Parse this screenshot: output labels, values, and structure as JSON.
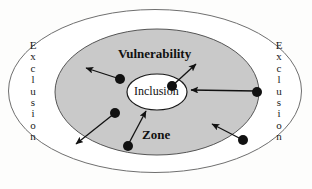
{
  "diagram": {
    "title_concept": "Vulnerability Zone",
    "labels": {
      "exclusion_left": "Exclusion",
      "exclusion_right": "Exclusion",
      "vulnerability": "Vulnerability",
      "zone": "Zone",
      "inclusion": "Inclusion"
    },
    "colors": {
      "outer_fill": "#ffffff",
      "outer_stroke": "#6f6f6f",
      "middle_fill": "#c9c9c9",
      "middle_stroke": "#555555",
      "inner_fill": "#ffffff",
      "inner_stroke": "#1a1a1a",
      "dot_fill": "#111111",
      "arrow_stroke": "#111111",
      "text": "#111111",
      "background": "#fdfdfc"
    },
    "ellipses": [
      {
        "name": "exclusion-outer-ellipse",
        "cx": 155,
        "cy": 91,
        "rx": 147,
        "ry": 82
      },
      {
        "name": "vulnerability-zone-ellipse",
        "cx": 157,
        "cy": 92,
        "rx": 102,
        "ry": 63
      },
      {
        "name": "inclusion-ellipse",
        "cx": 157,
        "cy": 92,
        "rx": 30,
        "ry": 18
      }
    ],
    "nodes": [
      {
        "name": "node-upper-left",
        "cx": 120,
        "cy": 79,
        "r": 5
      },
      {
        "name": "node-upper-right",
        "cx": 172,
        "cy": 86,
        "r": 5
      },
      {
        "name": "node-mid-left",
        "cx": 115,
        "cy": 113,
        "r": 5
      },
      {
        "name": "node-right-edge",
        "cx": 257,
        "cy": 92,
        "r": 5
      },
      {
        "name": "node-bottom-center",
        "cx": 128,
        "cy": 146,
        "r": 5
      },
      {
        "name": "node-bottom-right",
        "cx": 243,
        "cy": 140,
        "r": 5
      }
    ],
    "arrows": [
      {
        "name": "arrow-out-upper-left",
        "x1": 120,
        "y1": 79,
        "x2": 85,
        "y2": 68,
        "direction": "outward"
      },
      {
        "name": "arrow-out-upper-right",
        "x1": 172,
        "y1": 86,
        "x2": 197,
        "y2": 63,
        "direction": "outward"
      },
      {
        "name": "arrow-out-lower-left",
        "x1": 115,
        "y1": 113,
        "x2": 75,
        "y2": 145,
        "direction": "outward"
      },
      {
        "name": "arrow-in-from-right",
        "x1": 257,
        "y1": 92,
        "x2": 190,
        "y2": 90,
        "direction": "inward"
      },
      {
        "name": "arrow-in-bottom-center",
        "x1": 128,
        "y1": 146,
        "x2": 146,
        "y2": 110,
        "direction": "inward"
      },
      {
        "name": "arrow-in-bottom-right",
        "x1": 243,
        "y1": 140,
        "x2": 211,
        "y2": 123,
        "direction": "inward"
      }
    ]
  }
}
